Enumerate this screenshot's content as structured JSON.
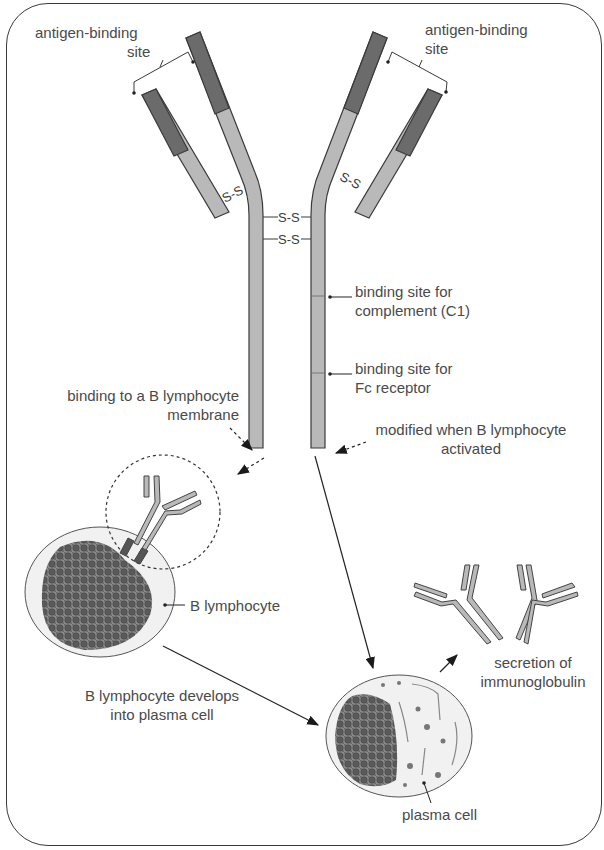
{
  "figure": {
    "labels": {
      "antigen_site_left_1": "antigen-binding",
      "antigen_site_left_2": "site",
      "antigen_site_right_1": "antigen-binding",
      "antigen_site_right_2": "site",
      "complement_1": "binding site for",
      "complement_2": "complement (C1)",
      "fc_1": "binding site for",
      "fc_2": "Fc receptor",
      "membrane_1": "binding to a B lymphocyte",
      "membrane_2": "membrane",
      "modified_1": "modified when B lymphocyte",
      "modified_2": "activated",
      "b_lymphocyte": "B lymphocyte",
      "develops_1": "B lymphocyte develops",
      "develops_2": "into plasma cell",
      "secretion_1": "secretion of",
      "secretion_2": "immunoglobulin",
      "plasma_cell": "plasma cell"
    },
    "disulfide_label": "S-S",
    "colors": {
      "variable_region": "#6b6b6b",
      "constant_region": "#b9b9b9",
      "outline": "#3a3a3a",
      "cell_fill": "#f1f1f1",
      "nucleus": "#6e6e6e",
      "text": "#4a4a4a"
    }
  }
}
